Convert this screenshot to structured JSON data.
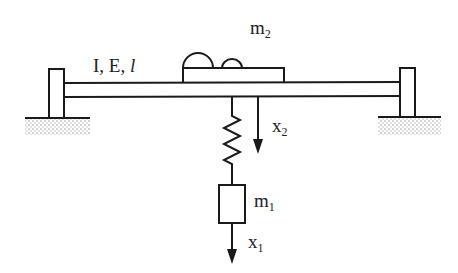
{
  "labels": {
    "beam": "I, E, ",
    "beam_length": "l",
    "m2_base": "m",
    "m2_sub": "2",
    "m1_base": "m",
    "m1_sub": "1",
    "x2_base": "x",
    "x2_sub": "2",
    "x1_base": "x",
    "x1_sub": "1"
  },
  "colors": {
    "stroke": "#1a1a1a",
    "ground": "#9a9a9a"
  }
}
